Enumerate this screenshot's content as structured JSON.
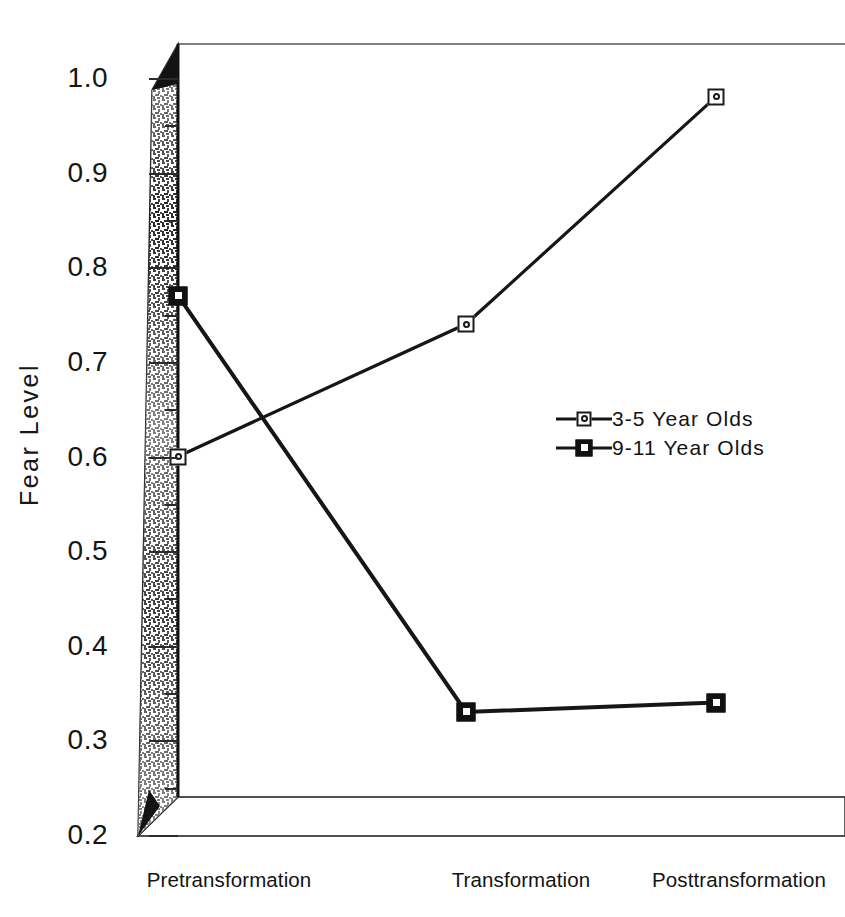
{
  "figure": {
    "scan_artifact_text": "",
    "y_axis_title": "Fear Level"
  },
  "chart_data": {
    "type": "line",
    "title": "",
    "xlabel": "",
    "ylabel": "Fear Level",
    "categories": [
      "Pretransformation",
      "Transformation",
      "Posttransformation"
    ],
    "ylim": [
      0.2,
      1.0
    ],
    "ytick_labels": [
      "1.0",
      "0.9",
      "0.8",
      "0.7",
      "0.6",
      "0.5",
      "0.4",
      "0.3",
      "0.2"
    ],
    "ytick_values": [
      1.0,
      0.9,
      0.8,
      0.7,
      0.6,
      0.5,
      0.4,
      0.3,
      0.2
    ],
    "minor_tick_step": 0.05,
    "grid": false,
    "legend_position": "center-right",
    "series": [
      {
        "name": "3-5 Year Olds",
        "marker": "open-square-circle",
        "values": [
          0.6,
          0.74,
          0.98
        ]
      },
      {
        "name": "9-11 Year Olds",
        "marker": "filled-square",
        "values": [
          0.77,
          0.33,
          0.34
        ]
      }
    ]
  },
  "legend": {
    "items": [
      {
        "label": "3-5 Year Olds"
      },
      {
        "label": "9-11 Year Olds"
      }
    ]
  },
  "colors": {
    "line": "#161616",
    "text": "#131313",
    "background": "#ffffff"
  }
}
